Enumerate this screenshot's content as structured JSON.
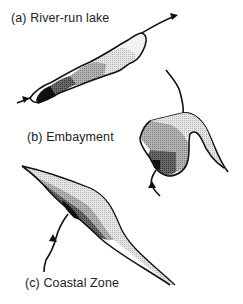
{
  "figure": {
    "panels": [
      {
        "id": "a",
        "label": "(a) River-run lake"
      },
      {
        "id": "b",
        "label": "(b) Embayment"
      },
      {
        "id": "c",
        "label": "(c) Coastal Zone"
      }
    ],
    "shading": {
      "darkest": "#111111",
      "dark": "#555555",
      "medium": "#9a9a9a",
      "light": "#cfcfcf",
      "lightest": "#ececec",
      "outline": "#111111"
    }
  }
}
